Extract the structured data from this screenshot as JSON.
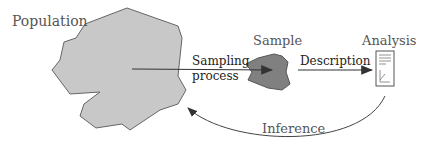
{
  "diagram": {
    "nodes": {
      "population": "Population",
      "sample": "Sample",
      "analysis": "Analysis"
    },
    "edges": {
      "sampling_line1": "Sampling",
      "sampling_line2": "process",
      "description": "Description",
      "inference": "Inference"
    },
    "colors": {
      "population_fill": "#c8c8c8",
      "sample_fill": "#808080",
      "stroke": "#555555"
    }
  }
}
